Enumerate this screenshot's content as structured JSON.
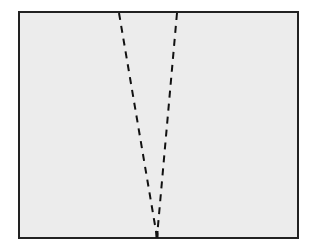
{
  "diagram": {
    "background": "#ffffff",
    "panel": {
      "x": 19,
      "y": 12,
      "width": 279,
      "height": 226,
      "fill": "#ececec",
      "stroke": "#222222",
      "stroke_width": 2
    },
    "dashed_lines": [
      {
        "name": "left-dashed-line",
        "x1": 119,
        "y1": 13,
        "x2": 157,
        "y2": 237
      },
      {
        "name": "right-dashed-line",
        "x1": 177,
        "y1": 13,
        "x2": 157,
        "y2": 237
      }
    ],
    "line_style": {
      "stroke": "#111111",
      "stroke_width": 2,
      "dasharray": "7 6"
    },
    "apex": {
      "x": 157,
      "y": 237
    }
  }
}
